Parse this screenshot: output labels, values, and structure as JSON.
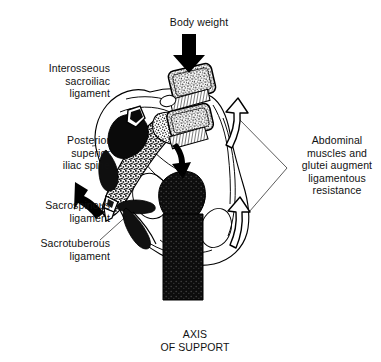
{
  "figure": {
    "background_color": "#ffffff",
    "ink_color": "#000000",
    "width": 381,
    "height": 362
  },
  "labels": {
    "body_weight": "Body weight",
    "interosseous": "Interosseous\nsacroiliac\nligament",
    "posterior_superior_iliac_spine": "Posterior\nsuperior\niliac spine",
    "sacrospinous": "Sacrospinous\nligament",
    "sacrotuberous": "Sacrotuberous\nligament",
    "abdominal": "Abdominal\nmuscles and\nglutei augment\nligamentous\nresistance",
    "axis_of_support": "AXIS\nOF SUPPORT"
  },
  "annotations": {
    "downward_force_arrow": "solid-black-down-arrow",
    "sacral_nutation_arrow": "solid-black-down-arrow-small",
    "iliac_rotation_arrow": "solid-black-curved-arrow-upleft",
    "upper_resistance_arrow": "hollow-curved-up-arrow",
    "lower_resistance_arrow": "hollow-curved-up-arrow"
  },
  "structures": {
    "vertebrae": [
      "L4-body",
      "L5-body"
    ],
    "sacrum": "stippled-sacrum",
    "ilium": "outlined-innominate-bone",
    "femur": "solid-black-femur",
    "interosseous_ligament_mass": "solid-black-ligament"
  }
}
